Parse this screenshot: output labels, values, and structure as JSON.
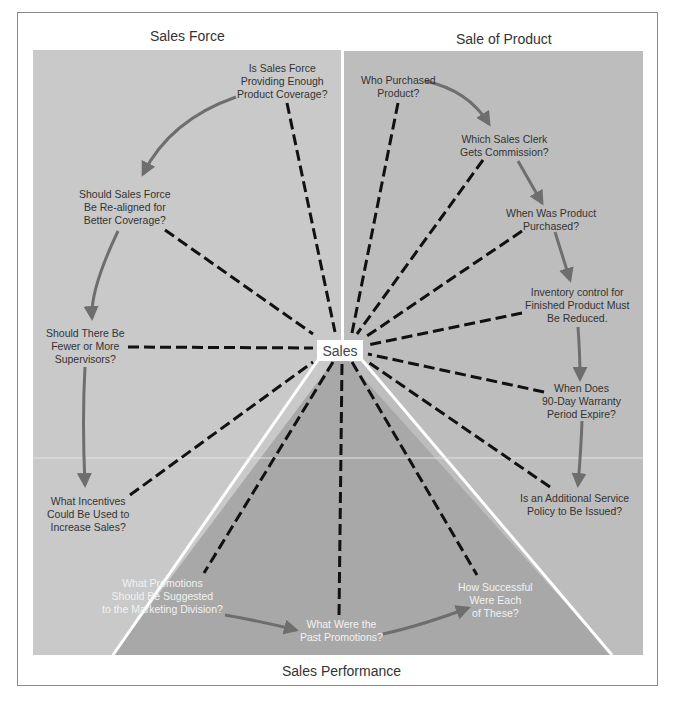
{
  "sections": {
    "top_left": "Sales Force",
    "top_right": "Sale of Product",
    "bottom": "Sales Performance"
  },
  "center": {
    "label": "Sales"
  },
  "colors": {
    "panel_left": "#c8c8c8",
    "panel_right": "#bdbdbd",
    "panel_bottom": "#a9a9a9",
    "arrow": "#6e6e6e",
    "dash": "#111111",
    "divider": "#ffffff"
  },
  "nodes": {
    "sales_force": [
      {
        "id": "sf1",
        "lines": [
          "Is Sales Force",
          "Providing Enough",
          "Product Coverage?"
        ]
      },
      {
        "id": "sf2",
        "lines": [
          "Should Sales Force",
          "Be Re-aligned for",
          "Better Coverage?"
        ]
      },
      {
        "id": "sf3",
        "lines": [
          "Should There Be",
          "Fewer or More",
          "Supervisors?"
        ]
      },
      {
        "id": "sf4",
        "lines": [
          "What Incentives",
          "Could Be Used to",
          "Increase Sales?"
        ]
      }
    ],
    "sale_of_product": [
      {
        "id": "sp1",
        "lines": [
          "Who Purchased",
          "Product?"
        ]
      },
      {
        "id": "sp2",
        "lines": [
          "Which Sales Clerk",
          "Gets Commission?"
        ]
      },
      {
        "id": "sp3",
        "lines": [
          "When Was Product",
          "Purchased?"
        ]
      },
      {
        "id": "sp4",
        "lines": [
          "Inventory control for",
          "Finished Product Must",
          "Be Reduced."
        ]
      },
      {
        "id": "sp5",
        "lines": [
          "When Does",
          "90-Day Warranty",
          "Period Expire?"
        ]
      },
      {
        "id": "sp6",
        "lines": [
          "Is an Additional Service",
          "Policy to Be Issued?"
        ]
      }
    ],
    "sales_performance": [
      {
        "id": "perf1",
        "lines": [
          "What Promotions",
          "Should Be Suggested",
          "to the Marketing Division?"
        ]
      },
      {
        "id": "perf2",
        "lines": [
          "What Were the",
          "Past Promotions?"
        ]
      },
      {
        "id": "perf3",
        "lines": [
          "How Successful",
          "Were Each",
          "of These?"
        ]
      }
    ]
  },
  "flows": [
    {
      "from": "sf1",
      "to": "sf2"
    },
    {
      "from": "sf2",
      "to": "sf3"
    },
    {
      "from": "sf3",
      "to": "sf4"
    },
    {
      "from": "sp1",
      "to": "sp2"
    },
    {
      "from": "sp2",
      "to": "sp3"
    },
    {
      "from": "sp3",
      "to": "sp4"
    },
    {
      "from": "sp4",
      "to": "sp5"
    },
    {
      "from": "sp5",
      "to": "sp6"
    },
    {
      "from": "perf1",
      "to": "perf2"
    },
    {
      "from": "perf2",
      "to": "perf3"
    }
  ],
  "connections_to_center": [
    "sf1",
    "sf2",
    "sf3",
    "sf4",
    "sp1",
    "sp2",
    "sp3",
    "sp4",
    "sp5",
    "sp6",
    "perf1",
    "perf2",
    "perf3"
  ]
}
